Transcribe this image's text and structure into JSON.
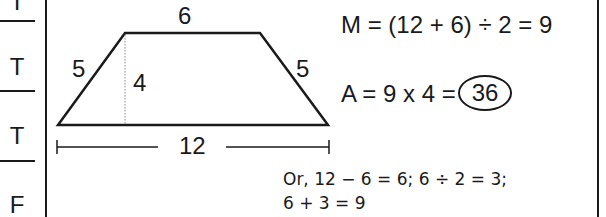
{
  "answers": [
    "T",
    "T",
    "T",
    "F"
  ],
  "diagram": {
    "shape": "isosceles trapezoid",
    "top_base": "6",
    "bottom_base": "12",
    "left_side": "5",
    "right_side": "5",
    "height": "4"
  },
  "formulas": {
    "median": "M = (12 + 6) ÷ 2 = 9",
    "area_prefix": "A = 9 x 4 =",
    "area_result": "36"
  },
  "alternate": {
    "line1": "Or, 12 − 6 = 6; 6 ÷ 2 = 3;",
    "line2": "6 + 3 = 9"
  },
  "colors": {
    "ink": "#1a1a1a",
    "background": "#ffffff"
  }
}
